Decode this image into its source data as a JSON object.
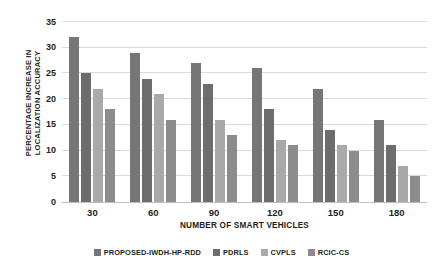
{
  "chart_data": {
    "type": "bar",
    "title": "",
    "subtitle": "",
    "xlabel": "NUMBER OF SMART VEHICLES",
    "ylabel": "PERCENTAGE INCREASE IN\nLOCALIZATION ACCURACY",
    "categories": [
      "30",
      "60",
      "90",
      "120",
      "150",
      "180"
    ],
    "series": [
      {
        "name": "PROPOSED-IWDH-HP-RDD",
        "color": "#767676",
        "values": [
          32,
          29,
          27,
          26,
          22,
          16
        ]
      },
      {
        "name": "PDRLS",
        "color": "#6d6d6d",
        "values": [
          25,
          24,
          23,
          18,
          14,
          11
        ]
      },
      {
        "name": "CVPLS",
        "color": "#a9a9a9",
        "values": [
          22,
          21,
          16,
          12,
          11,
          7
        ]
      },
      {
        "name": "RCIC-CS",
        "color": "#8c8c8c",
        "values": [
          18,
          16,
          13,
          11,
          10,
          5
        ]
      }
    ],
    "ylim": [
      0,
      35
    ],
    "ytick_labels": [
      "0",
      "5",
      "10",
      "15",
      "20",
      "25",
      "30",
      "35"
    ],
    "ytick_values": [
      0,
      5,
      10,
      15,
      20,
      25,
      30,
      35
    ],
    "grid": true,
    "grid_color": "#d9d9d9",
    "legend_position": "bottom",
    "background_color": "#ffffff",
    "axis_text_color": "#231f20"
  }
}
